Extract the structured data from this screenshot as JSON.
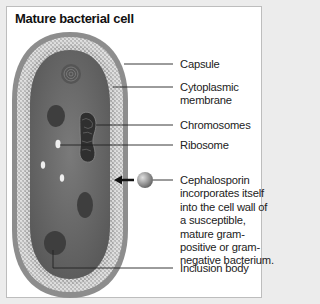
{
  "title": "Mature bacterial cell",
  "labels": {
    "capsule": "Capsule",
    "cytoplasmic_membrane_1": "Cytoplasmic",
    "cytoplasmic_membrane_2": "membrane",
    "chromosomes": "Chromosomes",
    "ribosome": "Ribosome",
    "cephalosporin": [
      "Cephalosporin",
      "incorporates itself",
      "into the cell wall of",
      "a susceptible,",
      "mature gram-",
      "positive or gram-",
      "negative bacterium."
    ],
    "inclusion_body": "Inclusion body"
  },
  "colors": {
    "capsule": "#8a8a8a",
    "wall": "#c4c4c4",
    "cytoplasm": "#6f6f6f",
    "background": "#ffffff"
  }
}
